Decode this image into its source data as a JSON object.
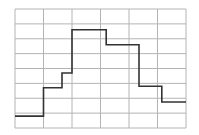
{
  "chart_data": {
    "type": "line",
    "style": "step",
    "title": "",
    "xlabel": "",
    "ylabel": "",
    "grid": true,
    "grid_columns": 6,
    "grid_rows": 8,
    "xlim": [
      0,
      6
    ],
    "ylim": [
      0,
      8
    ],
    "series": [
      {
        "name": "step-series",
        "points": [
          [
            0.0,
            0.8
          ],
          [
            1.0,
            0.8
          ],
          [
            1.0,
            2.7
          ],
          [
            1.65,
            2.7
          ],
          [
            1.65,
            3.7
          ],
          [
            2.0,
            3.7
          ],
          [
            2.0,
            6.6
          ],
          [
            3.2,
            6.6
          ],
          [
            3.2,
            5.6
          ],
          [
            4.35,
            5.6
          ],
          [
            4.35,
            2.8
          ],
          [
            5.15,
            2.8
          ],
          [
            5.15,
            1.75
          ],
          [
            6.0,
            1.75
          ]
        ]
      }
    ],
    "colors": {
      "grid": "#b4b4b4",
      "line": "#333333",
      "background": "#ffffff"
    }
  }
}
